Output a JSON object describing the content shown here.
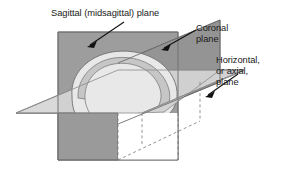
{
  "figure": {
    "background_color": "#ffffff"
  },
  "labels": {
    "sagittal": {
      "lines": [
        "Sagittal (midsagittal) plane"
      ],
      "line1": "Sagittal (midsagittal) plane"
    },
    "coronal": {
      "lines": [
        "Coronal",
        "plane"
      ],
      "line1": "Coronal",
      "line2": "plane"
    },
    "horizontal": {
      "lines": [
        "Horizontal,",
        "or axial,",
        "plane"
      ],
      "line1": "Horizontal,",
      "line2": "or axial,",
      "line3": "plane"
    }
  },
  "planes": {
    "sagittal": {
      "name": "Sagittal (midsagittal) plane",
      "fill": "#9a9a9a",
      "stroke": "#6e6e6e",
      "orientation": "vertical-frontal-rectangle"
    },
    "coronal": {
      "name": "Coronal plane",
      "fill": "#949494",
      "stroke": "#6e6e6e",
      "orientation": "vertical-receding-parallelogram"
    },
    "horizontal": {
      "name": "Horizontal, or axial, plane",
      "fill": "#d8d8d8",
      "stroke": "#8c8c8c",
      "orientation": "horizontal-parallelogram"
    }
  },
  "brain": {
    "name": "brain",
    "fill": "#e8e8e8",
    "rim_fill": "#c6c6c6",
    "stroke": "#6f6f6f"
  },
  "leaders": {
    "stroke": "#111111",
    "sagittal_arrow": "points down-left into sagittal plane",
    "coronal_arrow": "points down-left into coronal plane",
    "horizontal_arrow": "points down-left into horizontal plane"
  },
  "colors": {
    "text": "#1a1a1a",
    "dashed_hidden_edge": "#7a7a7a"
  }
}
